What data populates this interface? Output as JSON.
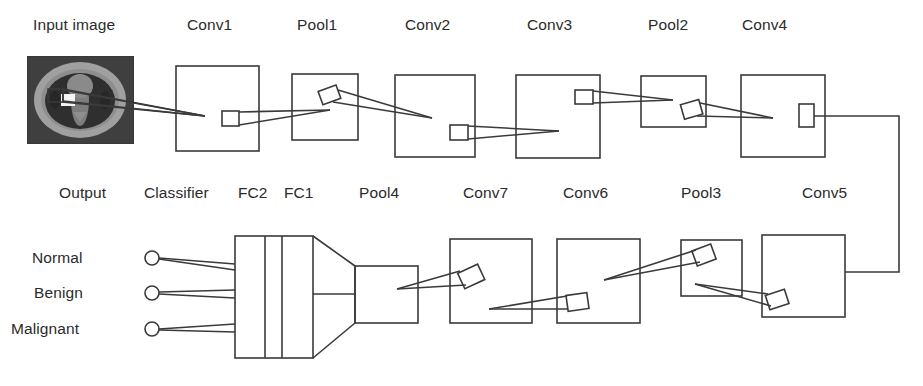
{
  "figure": {
    "type": "diagram",
    "background_color": "#ffffff",
    "stroke_color": "#3a3a3a",
    "text_color": "#2b2b2b"
  },
  "top_row": {
    "labels": [
      {
        "id": "input-image",
        "text": "Input image",
        "x": 33,
        "y": 16
      },
      {
        "id": "conv1",
        "text": "Conv1",
        "x": 187,
        "y": 16
      },
      {
        "id": "pool1",
        "text": "Pool1",
        "x": 297,
        "y": 16
      },
      {
        "id": "conv2",
        "text": "Conv2",
        "x": 405,
        "y": 16
      },
      {
        "id": "conv3",
        "text": "Conv3",
        "x": 527,
        "y": 16
      },
      {
        "id": "pool2",
        "text": "Pool2",
        "x": 648,
        "y": 16
      },
      {
        "id": "conv4",
        "text": "Conv4",
        "x": 742,
        "y": 16
      }
    ],
    "blocks": [
      {
        "id": "input-image-thumb",
        "x": 27,
        "y": 56,
        "w": 107,
        "h": 88
      },
      {
        "id": "conv1-block",
        "x": 176,
        "y": 66,
        "w": 83,
        "h": 85
      },
      {
        "id": "pool1-block",
        "x": 292,
        "y": 74,
        "w": 66,
        "h": 66
      },
      {
        "id": "conv2-block",
        "x": 395,
        "y": 75,
        "w": 80,
        "h": 82
      },
      {
        "id": "conv3-block",
        "x": 516,
        "y": 75,
        "w": 84,
        "h": 83
      },
      {
        "id": "pool2-block",
        "x": 641,
        "y": 76,
        "w": 65,
        "h": 51
      },
      {
        "id": "conv4-block",
        "x": 741,
        "y": 75,
        "w": 84,
        "h": 82
      }
    ]
  },
  "bottom_row": {
    "labels": [
      {
        "id": "output",
        "text": "Output",
        "x": 59,
        "y": 184
      },
      {
        "id": "classifier",
        "text": "Classifier",
        "x": 144,
        "y": 184
      },
      {
        "id": "fc2",
        "text": "FC2",
        "x": 238,
        "y": 184
      },
      {
        "id": "fc1",
        "text": "FC1",
        "x": 284,
        "y": 184
      },
      {
        "id": "pool4",
        "text": "Pool4",
        "x": 359,
        "y": 184
      },
      {
        "id": "conv7",
        "text": "Conv7",
        "x": 463,
        "y": 184
      },
      {
        "id": "conv6",
        "text": "Conv6",
        "x": 563,
        "y": 184
      },
      {
        "id": "pool3",
        "text": "Pool3",
        "x": 681,
        "y": 184
      },
      {
        "id": "conv5",
        "text": "Conv5",
        "x": 802,
        "y": 184
      }
    ],
    "class_labels": [
      {
        "id": "normal",
        "text": "Normal",
        "x": 30,
        "y": 249,
        "node_cx": 152,
        "node_cy": 258
      },
      {
        "id": "benign",
        "text": "Benign",
        "x": 30,
        "y": 284,
        "node_cx": 152,
        "node_cy": 293
      },
      {
        "id": "malignant",
        "text": "Malignant",
        "x": 10,
        "y": 320,
        "node_cx": 152,
        "node_cy": 329
      }
    ],
    "blocks": [
      {
        "id": "pool4-block",
        "x": 355,
        "y": 266,
        "w": 63,
        "h": 57
      },
      {
        "id": "conv7-block",
        "x": 450,
        "y": 239,
        "w": 82,
        "h": 84
      },
      {
        "id": "conv6-block",
        "x": 557,
        "y": 239,
        "w": 83,
        "h": 84
      },
      {
        "id": "pool3-block",
        "x": 681,
        "y": 240,
        "w": 61,
        "h": 56
      },
      {
        "id": "conv5-block",
        "x": 762,
        "y": 235,
        "w": 83,
        "h": 82
      }
    ],
    "fc_block": {
      "id": "fc-stack",
      "x": 235,
      "y": 236,
      "w": 78,
      "h": 122,
      "dividers": [
        265,
        282
      ]
    },
    "funnel": {
      "id": "classifier-funnel",
      "x_left": 313,
      "x_right": 355,
      "y_top": 236,
      "y_bottom": 358,
      "y_mid_top": 266,
      "y_mid_bottom": 323
    }
  },
  "connector": {
    "id": "row-connector",
    "description": "wire from Conv4 feature box down to Conv5 right edge",
    "points": "813,116 899,116 899,272 845,272"
  },
  "input_thumbnail": {
    "id": "ct-slice",
    "alt": "axial chest CT slice with bright nodule marker",
    "bg": "#3d3d3d",
    "body": "#9a9a9a",
    "lung": "#323232",
    "nodule": "#f2f2f2"
  }
}
